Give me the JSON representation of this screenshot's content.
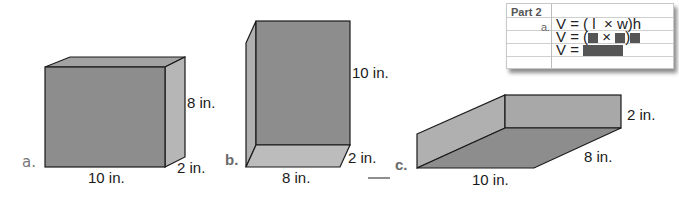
{
  "figures": {
    "a": {
      "letter": "a.",
      "length": "10 in.",
      "height": "8 in.",
      "width": "2 in."
    },
    "b": {
      "letter": "b.",
      "length": "8 in.",
      "height": "10 in.",
      "width": "2 in."
    },
    "c": {
      "letter": "c.",
      "length": "10 in.",
      "width": "8 in.",
      "height": "2 in."
    }
  },
  "card": {
    "title": "Part 2",
    "sub_label": "a.",
    "formula_prefix": "V = ( l",
    "formula_times": "× w)h",
    "line2_prefix": "V = (",
    "line2_times": "×",
    "line2_close": ")",
    "line3_prefix": "V ="
  },
  "colors": {
    "front_face": "#8c8c8c",
    "side_face": "#b0b0b0",
    "top_face": "#a0a0a0",
    "edge": "#1a1a1a"
  }
}
